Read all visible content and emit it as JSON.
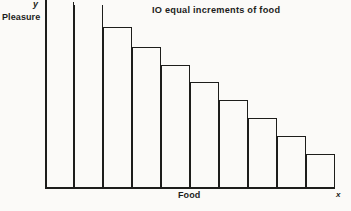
{
  "figure": {
    "background_color": "#fbfaf8",
    "ink_color": "#1d1d1b"
  },
  "chart_data": {
    "type": "bar",
    "title": "IO equal increments of food",
    "xlabel": "Food",
    "ylabel": "Pleasure",
    "x_axis_symbol": "x",
    "y_axis_symbol": "y",
    "grid": false,
    "legend": "none",
    "categories": [
      "1",
      "2",
      "3",
      "4",
      "5",
      "6",
      "7",
      "8",
      "9",
      "10"
    ],
    "values": [
      100,
      98,
      86,
      75,
      65,
      56,
      47,
      38,
      29,
      21
    ],
    "value_units": "relative pleasure (arbitrary units)",
    "clipped_bars": [
      1,
      2
    ],
    "xlim": [
      0,
      10
    ],
    "ylim": [
      0,
      100
    ],
    "bars": [
      {
        "index": 1,
        "value": 100,
        "clipped": true
      },
      {
        "index": 2,
        "value": 98,
        "clipped": true
      },
      {
        "index": 3,
        "value": 86,
        "clipped": false
      },
      {
        "index": 4,
        "value": 75,
        "clipped": false
      },
      {
        "index": 5,
        "value": 65,
        "clipped": false
      },
      {
        "index": 6,
        "value": 56,
        "clipped": false
      },
      {
        "index": 7,
        "value": 47,
        "clipped": false
      },
      {
        "index": 8,
        "value": 38,
        "clipped": false
      },
      {
        "index": 9,
        "value": 29,
        "clipped": false
      },
      {
        "index": 10,
        "value": 21,
        "clipped": false
      }
    ]
  },
  "geometry": {
    "plot_left": 45,
    "plot_baseline": 187,
    "bar_width": 29,
    "bar_tops_px": [
      2,
      5,
      27,
      47,
      65,
      82,
      100,
      118,
      136,
      154
    ]
  }
}
